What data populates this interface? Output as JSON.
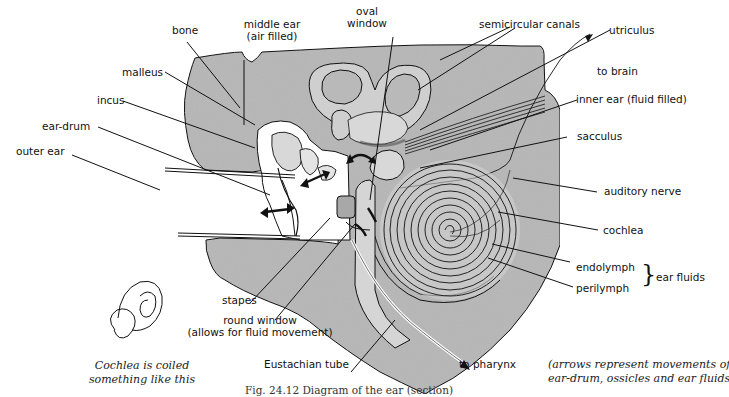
{
  "figure": {
    "caption": "Fig. 24.12   Diagram of the ear (section)",
    "colors": {
      "bone": "#b9b9b9",
      "bone_dark": "#a6a6a6",
      "fluid": "#d9d9d9",
      "line": "#111111",
      "background": "#ffffff"
    }
  },
  "labels": {
    "bone": "bone",
    "middle_ear_1": "middle ear",
    "middle_ear_2": "(air filled)",
    "oval_window_1": "oval",
    "oval_window_2": "window",
    "semicircular_canals": "semicircular canals",
    "utriculus": "utriculus",
    "to_brain": "to brain",
    "inner_ear": "inner ear (fluid filled)",
    "malleus": "malleus",
    "incus": "incus",
    "ear_drum": "ear-drum",
    "outer_ear": "outer ear",
    "sacculus": "sacculus",
    "auditory_nerve": "auditory nerve",
    "cochlea": "cochlea",
    "endolymph": "endolymph",
    "perilymph": "perilymph",
    "ear_fluids": "ear fluids",
    "stapes": "stapes",
    "round_window_1": "round window",
    "round_window_2": "(allows for fluid movement)",
    "eustachian_tube": "Eustachian tube",
    "to_pharynx": "to pharynx"
  },
  "notes": {
    "cochlea_note_1": "Cochlea is coiled",
    "cochlea_note_2": "something like this",
    "arrows_note_1": "(arrows represent movements of",
    "arrows_note_2": "ear-drum, ossicles and ear fluids)"
  },
  "icons": {
    "brace": "}"
  }
}
